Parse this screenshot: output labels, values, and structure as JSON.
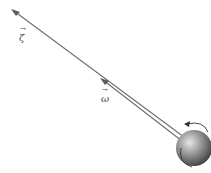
{
  "diagram": {
    "title": "",
    "vectors": [
      {
        "id": "zeta",
        "symbol": "ζ",
        "label_pos": [
          19,
          33
        ]
      },
      {
        "id": "omega",
        "symbol": "ω",
        "label_pos": [
          101,
          93
        ]
      }
    ],
    "colors": {
      "line": "#6e6e6e",
      "sphere_light": "#d8d8d8",
      "sphere_dark": "#4a4a4a",
      "label": "#444444"
    },
    "sphere": {
      "cx": 194,
      "cy": 148,
      "r": 18
    },
    "rotation_indicator": "curved-arrow"
  }
}
